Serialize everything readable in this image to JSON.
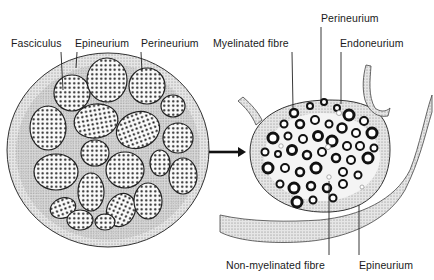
{
  "figure": {
    "left_panel": {
      "title": "Nerve cross-section",
      "labels": {
        "fasciculus": "Fasciculus",
        "epineurium": "Epineurium",
        "perineurium": "Perineurium"
      }
    },
    "right_panel": {
      "title": "Fasciculus detail",
      "labels": {
        "myelinated_fibre": "Myelinated fibre",
        "perineurium": "Perineurium",
        "endoneurium": "Endoneurium",
        "non_myelinated_fibre": "Non-myelinated fibre",
        "epineurium": "Epineurium"
      }
    },
    "arrow": "right-arrow",
    "colors": {
      "ink": "#1a1a1a",
      "stipple_fill": "#d8d8d8",
      "background": "#ffffff"
    }
  }
}
